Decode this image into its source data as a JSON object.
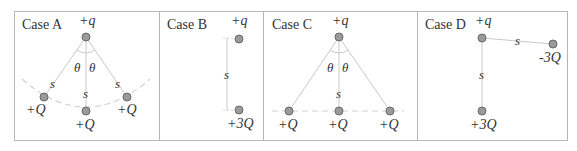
{
  "colors": {
    "border": "#b5b5b5",
    "line": "#c8c8c8",
    "dashed": "#d2d2d2",
    "charge_fill": "#9a9a9a",
    "charge_stroke": "#6a6a6a",
    "text": "#333333"
  },
  "cases": [
    {
      "label": "Case A",
      "source_charge": "+q",
      "angle_labels": [
        "θ",
        "θ"
      ],
      "distance_labels": [
        "s",
        "s",
        "s"
      ],
      "charges": [
        "+Q",
        "+Q",
        "+Q"
      ]
    },
    {
      "label": "Case B",
      "source_charge": "+q",
      "distance_labels": [
        "s"
      ],
      "charges": [
        "+3Q"
      ]
    },
    {
      "label": "Case C",
      "source_charge": "+q",
      "angle_labels": [
        "θ",
        "θ"
      ],
      "distance_labels": [
        "s"
      ],
      "charges": [
        "+Q",
        "+Q",
        "+Q"
      ]
    },
    {
      "label": "Case D",
      "source_charge": "+q",
      "distance_labels": [
        "s",
        "s"
      ],
      "charges": [
        "-3Q",
        "+3Q"
      ]
    }
  ]
}
